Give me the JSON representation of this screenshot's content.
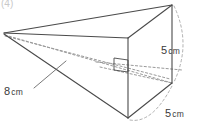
{
  "figure": {
    "tag": "(4)",
    "shape_name": "triangular-pyramid-on-prism",
    "labels": {
      "length": {
        "value": "8",
        "unit": "cm",
        "full": "8 cm"
      },
      "height": {
        "value": "5",
        "unit": "cm",
        "full": "5 cm"
      },
      "depth": {
        "value": "5",
        "unit": "cm",
        "full": "5 cm"
      }
    },
    "colors": {
      "stroke": "#4a4a4a",
      "hidden_stroke": "#9a9a9a",
      "background": "#ffffff",
      "text": "#3a3a3a"
    },
    "vertices": {
      "apex": [
        4,
        33
      ],
      "top_rear": [
        172,
        5
      ],
      "top_front": [
        128,
        38
      ],
      "bottom_front": [
        128,
        118
      ],
      "rear_right": [
        172,
        83
      ]
    },
    "annotations": {
      "right_angle_marker": true,
      "leader_line_from": "8 cm",
      "dimension_braces": [
        "height",
        "depth"
      ]
    }
  }
}
